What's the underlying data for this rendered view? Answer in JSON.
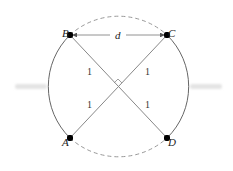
{
  "diagram": {
    "points": [
      {
        "id": "A",
        "label": "A"
      },
      {
        "id": "B",
        "label": "B"
      },
      {
        "id": "C",
        "label": "C"
      },
      {
        "id": "D",
        "label": "D"
      }
    ],
    "distance_label": "d",
    "segment_labels": [
      "1",
      "1",
      "1",
      "1"
    ],
    "colors": {
      "solid_arc": "#666666",
      "dashed_arc": "#999999",
      "chords": "#888888",
      "points": "#000000"
    }
  }
}
